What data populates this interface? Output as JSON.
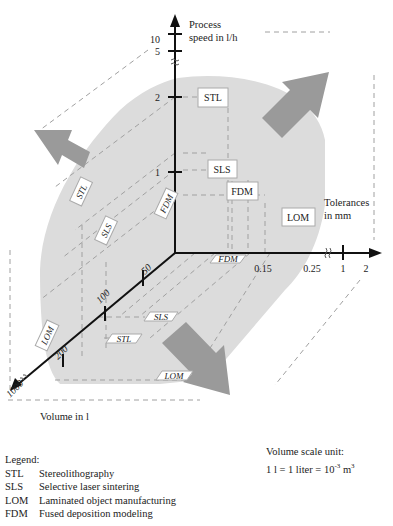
{
  "axes": {
    "vertical": {
      "label_line1": "Process",
      "label_line2": "speed in l/h",
      "ticks": [
        "10",
        "5",
        "2",
        "1"
      ]
    },
    "horizontal": {
      "label_line1": "Tolerances",
      "label_line2": "in mm",
      "ticks": [
        "0.15",
        "0.25",
        "1",
        "2"
      ]
    },
    "depth": {
      "label": "Volume in l",
      "ticks": [
        "50",
        "100",
        "200",
        "1000"
      ]
    }
  },
  "process_labels": {
    "speed_plane": [
      "STL",
      "SLS",
      "FDM",
      "LOM"
    ],
    "volume_speed_plane": [
      "STL",
      "SLS",
      "FDM",
      "LOM"
    ],
    "floor_plane": [
      "FDM",
      "SLS",
      "STL",
      "LOM"
    ]
  },
  "legend": {
    "title": "Legend:",
    "items": [
      {
        "abbr": "STL",
        "name": "Stereolithography"
      },
      {
        "abbr": "SLS",
        "name": "Selective laser sintering"
      },
      {
        "abbr": "LOM",
        "name": "Laminated object manufacturing"
      },
      {
        "abbr": "FDM",
        "name": "Fused deposition modeling"
      }
    ]
  },
  "unit_note": {
    "line1": "Volume scale unit:",
    "line2_prefix": "1 l = 1 liter = 10",
    "exp1": "-3",
    "line2_mid": " m",
    "exp2": "3"
  },
  "colors": {
    "region": "#dcdcdc",
    "arrow": "#9a9a9a",
    "axis": "#111111",
    "dashed": "#9d9d9d"
  }
}
